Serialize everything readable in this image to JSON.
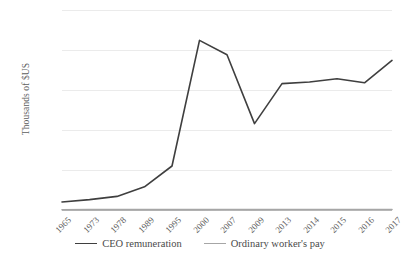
{
  "chart_data": {
    "type": "line",
    "title": "",
    "xlabel": "",
    "ylabel": "Thousands of $US",
    "categories": [
      "1965",
      "1973",
      "1978",
      "1989",
      "1995",
      "2000",
      "2007",
      "2009",
      "2013",
      "2014",
      "2015",
      "2016",
      "2017"
    ],
    "ylim": [
      0,
      25000
    ],
    "yticks": [
      0,
      5000,
      10000,
      15000,
      20000,
      25000
    ],
    "ytick_labels": [
      "0",
      "5,000",
      "10,000",
      "15,000",
      "20,000",
      "25,000"
    ],
    "grid": true,
    "legend_position": "bottom",
    "series": [
      {
        "name": "CEO remuneration",
        "color": "#3f3f3f",
        "values": [
          1000,
          1300,
          1700,
          2900,
          5500,
          21200,
          19400,
          10800,
          15800,
          16000,
          16400,
          15900,
          18700
        ]
      },
      {
        "name": "Ordinary worker's pay",
        "color": "#a6a6a6",
        "values": [
          40,
          42,
          45,
          48,
          50,
          52,
          54,
          53,
          55,
          56,
          57,
          58,
          60
        ]
      }
    ]
  },
  "legend": {
    "items": [
      {
        "label": "CEO remuneration",
        "color": "#3f3f3f"
      },
      {
        "label": "Ordinary worker's pay",
        "color": "#a6a6a6"
      }
    ]
  },
  "colors": {
    "gridline": "#ebebeb",
    "axis": "#bdbdbd",
    "text": "#5e5e5e",
    "background": "#ffffff"
  }
}
